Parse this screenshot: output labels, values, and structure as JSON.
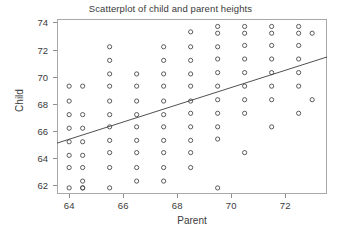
{
  "chart_data": {
    "type": "scatter",
    "title": "Scatterplot of child and parent heights",
    "xlabel": "Parent",
    "ylabel": "Child",
    "xlim": [
      63.55,
      73.55
    ],
    "ylim": [
      61.35,
      74.25
    ],
    "grid": false,
    "legend": null,
    "marker": {
      "shape": "open-circle",
      "size": 4.2,
      "edge_color": "#4a4a4a",
      "fill": "none"
    },
    "xticks": [
      64,
      66,
      68,
      70,
      72
    ],
    "yticks": [
      62,
      64,
      66,
      68,
      70,
      72,
      74
    ],
    "xtick_labels": [
      "64",
      "66",
      "68",
      "70",
      "72"
    ],
    "ytick_labels": [
      "62",
      "64",
      "66",
      "68",
      "70",
      "72",
      "74"
    ],
    "trend_line": {
      "type": "linear-regression",
      "color": "#3c3c3c",
      "width": 0.9,
      "x_start": 63.55,
      "y_start": 65.1,
      "x_end": 73.55,
      "y_end": 71.45
    },
    "x": [
      64,
      64,
      64,
      64,
      64,
      64,
      64,
      64,
      64.5,
      64.5,
      64.5,
      64.5,
      64.5,
      64.5,
      64.5,
      64.5,
      64.5,
      65.5,
      65.5,
      65.5,
      65.5,
      65.5,
      65.5,
      65.5,
      65.5,
      65.5,
      65.5,
      65.5,
      66.5,
      66.5,
      66.5,
      66.5,
      66.5,
      66.5,
      66.5,
      66.5,
      66.5,
      67.5,
      67.5,
      67.5,
      67.5,
      67.5,
      67.5,
      67.5,
      67.5,
      67.5,
      67.5,
      67.5,
      68.5,
      68.5,
      68.5,
      68.5,
      68.5,
      68.5,
      68.5,
      68.5,
      68.5,
      68.5,
      68.5,
      69.5,
      69.5,
      69.5,
      69.5,
      69.5,
      69.5,
      69.5,
      69.5,
      69.5,
      69.5,
      69.5,
      70.5,
      70.5,
      70.5,
      70.5,
      70.5,
      70.5,
      70.5,
      70.5,
      70.5,
      71.5,
      71.5,
      71.5,
      71.5,
      71.5,
      71.5,
      71.5,
      71.5,
      72.5,
      72.5,
      72.5,
      72.5,
      72.5,
      72.5,
      72.5,
      73,
      73
    ],
    "y": [
      69.3,
      68.2,
      67.2,
      66.2,
      65.2,
      64.2,
      63.3,
      61.8,
      69.3,
      67.2,
      66.2,
      65.2,
      64.2,
      63.3,
      62.3,
      61.8,
      61.8,
      72.2,
      71.2,
      70.2,
      69.3,
      68.2,
      67.2,
      66.3,
      65.3,
      64.4,
      63.3,
      61.8,
      70.2,
      69.3,
      68.2,
      67.2,
      66.3,
      65.3,
      64.4,
      63.3,
      62.3,
      72.2,
      71.2,
      70.2,
      69.3,
      68.2,
      67.2,
      66.3,
      65.3,
      64.4,
      63.3,
      62.3,
      73.3,
      72.2,
      71.2,
      70.2,
      69.3,
      68.2,
      67.3,
      66.3,
      65.3,
      64.4,
      63.3,
      61.8,
      73.7,
      73.2,
      72.2,
      71.3,
      70.3,
      69.3,
      68.3,
      67.3,
      66.3,
      65.4,
      64.4,
      73.7,
      73.2,
      72.3,
      71.3,
      70.3,
      69.3,
      68.3,
      67.3,
      66.3,
      73.7,
      73.2,
      72.3,
      71.3,
      70.3,
      69.3,
      68.3,
      67.3,
      73.7,
      73.2,
      72.3,
      71.3,
      70.3,
      69.3,
      68.3,
      73.2,
      72.3
    ]
  }
}
